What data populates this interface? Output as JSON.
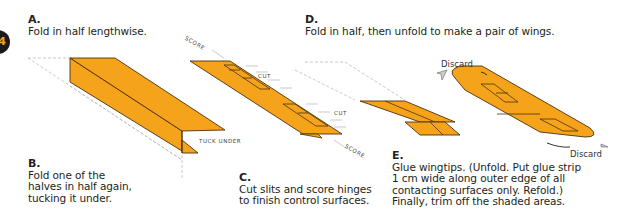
{
  "diagram": {
    "badge_number": "4",
    "colors": {
      "paper": "#f5a31a",
      "outline": "#4a3210",
      "guide": "#bbbbbb",
      "text": "#231f20"
    },
    "steps": [
      {
        "letter": "A.",
        "text": "Fold in half lengthwise."
      },
      {
        "letter": "B.",
        "text": "Fold one of the\nhalves in half again,\ntucking it under."
      },
      {
        "letter": "C.",
        "text": "Cut slits and score hinges\nto finish control surfaces."
      },
      {
        "letter": "D.",
        "text": "Fold in half, then unfold to make a pair of wings."
      },
      {
        "letter": "E.",
        "text": "Glue wingtips. (Unfold. Put glue strip\n1 cm wide along outer edge of all\ncontacting surfaces only. Refold.)\nFinally, trim off the shaded areas."
      }
    ],
    "labels": {
      "score_top": "SCORE",
      "score_bottom": "SCORE",
      "cut_top": "CUT",
      "cut_bottom": "CUT",
      "tuck_under": "TUCK UNDER",
      "discard_top": "Discard",
      "discard_bottom": "Discard"
    }
  }
}
